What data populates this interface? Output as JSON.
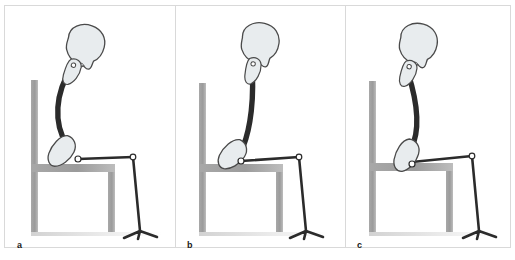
{
  "figure": {
    "width": 515,
    "height": 260,
    "background": "#ffffff",
    "frame_color": "#d9d9d9"
  },
  "colors": {
    "bone_fill": "#e8ecee",
    "bone_outline": "#4a4a4a",
    "spine": "#2b2b2b",
    "limb": "#2b2b2b",
    "chair": "#9b9b9b",
    "chair_shadow": "#c9c9c9",
    "floor_shadow": "#d5d5d5",
    "label_text": "#1a1a1a",
    "joint_fill": "#ffffff"
  },
  "panels": [
    {
      "id": "a",
      "label": "a",
      "posture": "slouched kyphotic sitting",
      "skull": "skull-icon",
      "scapula": "scapula-icon",
      "pelvis": "pelvis-icon",
      "chair": "chair-icon",
      "spine_path": "M 67 62 C 50 88, 48 118, 62 140",
      "neck_path": "M 76 42 C 73 50, 70 56, 67 62",
      "skull_transform": "translate(64,14) rotate(14)",
      "scapula_transform": "translate(62,50) rotate(16)",
      "pelvis_transform": "translate(53,125) rotate(26)",
      "hip_joint": {
        "cx": 73,
        "cy": 154,
        "r": 3.0
      },
      "knee_joint": {
        "cx": 128,
        "cy": 152,
        "r": 2.8
      },
      "thigh_path": "M 73 154 L 128 152",
      "shank_path": "M 128 152 L 135 226",
      "foot_path": "M 135 226 L 119 233 M 135 226 L 152 232 M 135 226 L 133 234",
      "chair_back": {
        "x": 26,
        "y": 75,
        "w": 7,
        "h": 152
      },
      "chair_seat": {
        "x": 26,
        "y": 159,
        "w": 84,
        "h": 8
      },
      "chair_leg": {
        "x": 103,
        "y": 167,
        "w": 7,
        "h": 60
      },
      "floor_y": 227
    },
    {
      "id": "b",
      "label": "b",
      "posture": "upright erect sitting",
      "skull": "skull-icon",
      "scapula": "scapula-icon",
      "pelvis": "pelvis-icon",
      "chair": "chair-icon",
      "spine_path": "M 77 65 C 79 92, 76 122, 68 142",
      "neck_path": "M 80 42 C 79 50, 78 58, 77 65",
      "skull_transform": "translate(66,14) rotate(8)",
      "scapula_transform": "translate(70,50) rotate(6)",
      "pelvis_transform": "translate(56,128) rotate(32)",
      "hip_joint": {
        "cx": 66,
        "cy": 156,
        "r": 3.0
      },
      "knee_joint": {
        "cx": 124,
        "cy": 152,
        "r": 2.8
      },
      "thigh_path": "M 66 156 L 124 152",
      "shank_path": "M 124 152 L 131 226",
      "foot_path": "M 131 226 L 115 233 M 131 226 L 148 232 M 131 226 L 129 234",
      "chair_back": {
        "x": 24,
        "y": 78,
        "w": 7,
        "h": 149
      },
      "chair_seat": {
        "x": 24,
        "y": 159,
        "w": 84,
        "h": 8
      },
      "chair_leg": {
        "x": 101,
        "y": 167,
        "w": 7,
        "h": 60
      },
      "floor_y": 227
    },
    {
      "id": "c",
      "label": "c",
      "posture": "lordotic anterior pelvic tilt sitting",
      "skull": "skull-icon",
      "scapula": "scapula-icon",
      "pelvis": "pelvis-icon",
      "chair": "chair-icon",
      "spine_path": "M 63 68 C 72 96, 76 124, 66 144",
      "neck_path": "M 72 42 C 69 50, 65 60, 63 68",
      "skull_transform": "translate(55,14) rotate(10)",
      "scapula_transform": "translate(57,52) rotate(12)",
      "pelvis_transform": "translate(54,130) rotate(16)",
      "hip_joint": {
        "cx": 67,
        "cy": 159,
        "r": 3.0
      },
      "knee_joint": {
        "cx": 127,
        "cy": 151,
        "r": 2.8
      },
      "thigh_path": "M 67 157 L 127 151",
      "shank_path": "M 127 151 L 134 226",
      "foot_path": "M 134 226 L 118 233 M 134 226 L 151 232 M 134 226 L 132 234",
      "chair_back": {
        "x": 24,
        "y": 76,
        "w": 7,
        "h": 151
      },
      "chair_seat": {
        "x": 24,
        "y": 158,
        "w": 84,
        "h": 8
      },
      "chair_leg": {
        "x": 101,
        "y": 166,
        "w": 7,
        "h": 61
      },
      "floor_y": 227
    }
  ]
}
